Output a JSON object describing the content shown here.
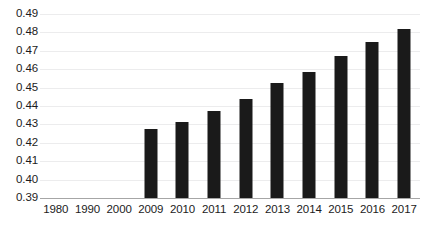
{
  "chart_data": {
    "type": "bar",
    "title": "",
    "subtitle": "",
    "xlabel": "",
    "ylabel": "",
    "categories": [
      "1980",
      "1990",
      "2000",
      "2009",
      "2010",
      "2011",
      "2012",
      "2013",
      "2014",
      "2015",
      "2016",
      "2017"
    ],
    "values": [
      null,
      null,
      null,
      0.4275,
      0.4315,
      0.4375,
      0.444,
      0.4525,
      0.4585,
      0.467,
      0.475,
      0.482
    ],
    "ylim": [
      0.39,
      0.49
    ],
    "yticks": [
      0.39,
      0.4,
      0.41,
      0.42,
      0.43,
      0.44,
      0.45,
      0.46,
      0.47,
      0.48,
      0.49
    ],
    "ytick_labels": [
      "0.39",
      "0.40",
      "0.41",
      "0.42",
      "0.43",
      "0.44",
      "0.45",
      "0.46",
      "0.47",
      "0.48",
      "0.49"
    ],
    "grid": true,
    "legend": false,
    "legend_position": "none",
    "bar_color": "#1a1a1a",
    "gridline_color": "#ececed",
    "axis_color": "#a6a6a6",
    "text_color": "#1c1c1c",
    "annotations": []
  }
}
